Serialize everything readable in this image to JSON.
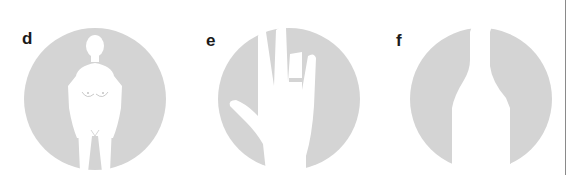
{
  "panels": [
    {
      "label": "d",
      "icon": "female-figure-icon"
    },
    {
      "label": "e",
      "icon": "hand-icon"
    },
    {
      "label": "f",
      "icon": "bottle-icon"
    }
  ],
  "colors": {
    "circle_fill": "#d4d4d4",
    "silhouette": "#ffffff",
    "label": "#1a1a1a",
    "rule": "#8a8a8a"
  }
}
